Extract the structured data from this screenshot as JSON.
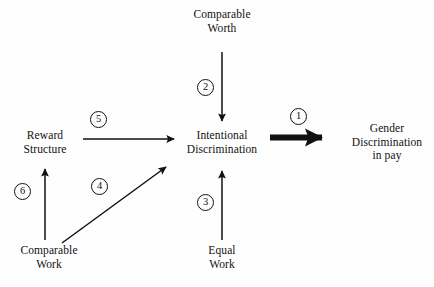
{
  "diagram": {
    "background_color": "#fefefe",
    "stroke_color": "#111111",
    "nodes": {
      "comparable_worth": {
        "line1": "Comparable",
        "line2": "Worth"
      },
      "reward_structure": {
        "line1": "Reward",
        "line2": "Structure"
      },
      "intentional_discrimination": {
        "line1": "Intentional",
        "line2": "Discrimination"
      },
      "gender_discrimination_in_pay": {
        "line1": "Gender",
        "line2": "Discrimination",
        "line3": "in pay"
      },
      "comparable_work": {
        "line1": "Comparable",
        "line2": "Work"
      },
      "equal_work": {
        "line1": "Equal",
        "line2": "Work"
      }
    },
    "markers": {
      "m1": "1",
      "m2": "2",
      "m3": "3",
      "m4": "4",
      "m5": "5",
      "m6": "6"
    },
    "arrows": [
      {
        "id": "arrow-1",
        "label": "1",
        "from": "intentional_discrimination",
        "to": "gender_discrimination_in_pay",
        "style": "bold",
        "direction": "right"
      },
      {
        "id": "arrow-2",
        "label": "2",
        "from": "comparable_worth",
        "to": "intentional_discrimination",
        "style": "thin",
        "direction": "down"
      },
      {
        "id": "arrow-3",
        "label": "3",
        "from": "equal_work",
        "to": "intentional_discrimination",
        "style": "thin",
        "direction": "up"
      },
      {
        "id": "arrow-4",
        "label": "4",
        "from": "comparable_work",
        "to": "intentional_discrimination",
        "style": "thin",
        "direction": "diagonal-up-right"
      },
      {
        "id": "arrow-5",
        "label": "5",
        "from": "reward_structure",
        "to": "intentional_discrimination",
        "style": "thin",
        "direction": "right"
      },
      {
        "id": "arrow-6",
        "label": "6",
        "from": "comparable_work",
        "to": "reward_structure",
        "style": "thin",
        "direction": "up"
      }
    ]
  }
}
